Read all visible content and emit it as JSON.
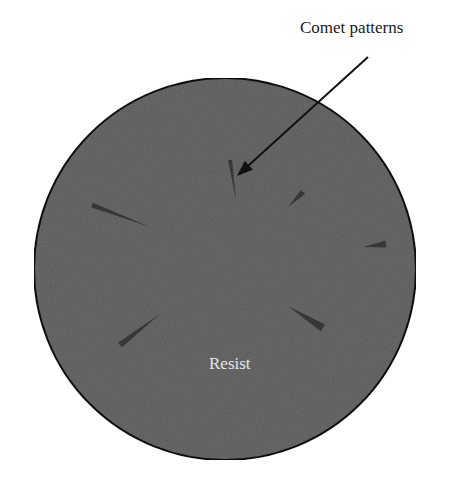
{
  "figure": {
    "labels": {
      "callout": "Comet patterns",
      "substrate": "Resist"
    },
    "colors": {
      "background": "#ffffff",
      "wafer_fill": "#6a6a6a",
      "wafer_outline": "#111111",
      "comet": "#2a2a2a",
      "callout_line": "#111111",
      "substrate_label": "#e6e6e6",
      "callout_label": "#1a1a1a"
    },
    "wafer": {
      "cx": 225,
      "cy": 269,
      "r": 191
    },
    "arrow": {
      "x1": 368,
      "y1": 57,
      "x2": 237,
      "y2": 176
    },
    "comets": [
      {
        "id": "comet-1",
        "x1": 236,
        "y1": 200,
        "x2": 230,
        "y2": 160,
        "width": 4
      },
      {
        "id": "comet-2",
        "x1": 288,
        "y1": 207,
        "x2": 303,
        "y2": 192,
        "width": 6
      },
      {
        "id": "comet-3",
        "x1": 150,
        "y1": 227,
        "x2": 92,
        "y2": 205,
        "width": 5
      },
      {
        "id": "comet-4",
        "x1": 363,
        "y1": 247,
        "x2": 386,
        "y2": 244,
        "width": 7
      },
      {
        "id": "comet-5",
        "x1": 160,
        "y1": 314,
        "x2": 120,
        "y2": 345,
        "width": 6
      },
      {
        "id": "comet-6",
        "x1": 288,
        "y1": 306,
        "x2": 323,
        "y2": 328,
        "width": 8
      }
    ]
  }
}
